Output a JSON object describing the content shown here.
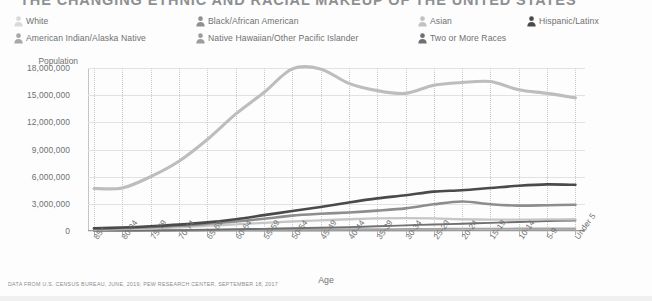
{
  "title": "THE CHANGING ETHNIC AND RACIAL MAKEUP OF THE UNITED STATES",
  "legend": {
    "columns": [
      {
        "x": 14,
        "items": [
          {
            "label": "White",
            "color": "#d9d9d9"
          },
          {
            "label": "American Indian/Alaska Native",
            "color": "#a8a8a8"
          }
        ]
      },
      {
        "x": 196,
        "items": [
          {
            "label": "Black/African American",
            "color": "#909090"
          },
          {
            "label": "Native Hawaiian/Other Pacific Islander",
            "color": "#9c9c9c"
          }
        ]
      },
      {
        "x": 418,
        "items": [
          {
            "label": "Asian",
            "color": "#c2c2c2"
          },
          {
            "label": "Two or More Races",
            "color": "#6f6f6f"
          }
        ]
      },
      {
        "x": 527,
        "items": [
          {
            "label": "Hispanic/Latinx",
            "color": "#4a4a4a"
          }
        ]
      }
    ]
  },
  "footer": "DATA FROM U.S. CENSUS BUREAU, JUNE, 2019; PEW RESEARCH CENTER, SEPTEMBER 18, 2017",
  "chart_data": {
    "type": "line",
    "title": "THE CHANGING ETHNIC AND RACIAL MAKEUP OF THE UNITED STATES",
    "xlabel": "Age",
    "ylabel": "Population",
    "ylim": [
      0,
      18000000
    ],
    "ytick_labels": [
      "18,000,000",
      "15,000,000",
      "12,000,000",
      "9,000,000",
      "6,000,000",
      "3,000,000",
      "0"
    ],
    "yticks": [
      18000000,
      15000000,
      12000000,
      9000000,
      6000000,
      3000000,
      0
    ],
    "grid": true,
    "legend_position": "top",
    "categories": [
      "85+",
      "80-84",
      "75-79",
      "70-74",
      "65-69",
      "60-64",
      "55-59",
      "50-54",
      "45-49",
      "40-44",
      "35-39",
      "30-34",
      "25-29",
      "20-24",
      "15-19",
      "10-14",
      "5-9",
      "Under 5"
    ],
    "series": [
      {
        "name": "White",
        "color": "#bdbdbd",
        "width": 3.1,
        "values": [
          4700000,
          4750000,
          6000000,
          7700000,
          10100000,
          12900000,
          15300000,
          17900000,
          17900000,
          16300000,
          15500000,
          15200000,
          16100000,
          16400000,
          16500000,
          15600000,
          15200000,
          14700000
        ]
      },
      {
        "name": "Hispanic/Latinx",
        "color": "#4a4a4a",
        "width": 2.6,
        "values": [
          300000,
          380000,
          520000,
          700000,
          950000,
          1300000,
          1750000,
          2200000,
          2650000,
          3150000,
          3600000,
          3950000,
          4350000,
          4500000,
          4750000,
          5000000,
          5150000,
          5100000
        ]
      },
      {
        "name": "Black/African American",
        "color": "#8d8d8d",
        "width": 2.6,
        "values": [
          260000,
          320000,
          430000,
          580000,
          800000,
          1050000,
          1350000,
          1700000,
          1900000,
          2050000,
          2250000,
          2500000,
          2950000,
          3250000,
          2950000,
          2800000,
          2850000,
          2900000
        ]
      },
      {
        "name": "Asian",
        "color": "#c6c6c6",
        "width": 2.3,
        "values": [
          160000,
          200000,
          280000,
          400000,
          560000,
          740000,
          900000,
          1050000,
          1180000,
          1300000,
          1400000,
          1420000,
          1400000,
          1300000,
          1250000,
          1250000,
          1280000,
          1300000
        ]
      },
      {
        "name": "Two or More Races",
        "color": "#707070",
        "width": 1.9,
        "values": [
          40000,
          50000,
          70000,
          100000,
          140000,
          190000,
          240000,
          300000,
          360000,
          430000,
          520000,
          620000,
          720000,
          800000,
          900000,
          1000000,
          1100000,
          1150000
        ]
      },
      {
        "name": "American Indian/Alaska Native",
        "color": "#a5a5a5",
        "width": 1.8,
        "values": [
          30000,
          36000,
          48000,
          64000,
          86000,
          110000,
          135000,
          160000,
          180000,
          195000,
          210000,
          225000,
          245000,
          255000,
          265000,
          275000,
          280000,
          285000
        ]
      },
      {
        "name": "Native Hawaiian/Other Pacific Islander",
        "color": "#9a9a9a",
        "width": 1.6,
        "values": [
          8000,
          10000,
          13000,
          17000,
          22000,
          28000,
          34000,
          40000,
          46000,
          52000,
          58000,
          64000,
          72000,
          78000,
          84000,
          90000,
          95000,
          98000
        ]
      }
    ]
  }
}
